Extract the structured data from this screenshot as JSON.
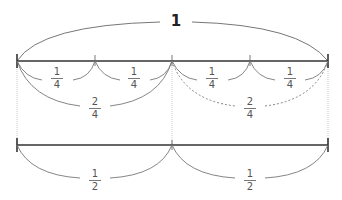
{
  "title": "1",
  "colors": {
    "number_line": "#333333",
    "arc": "#777777",
    "guide": "#bbbbbb",
    "label": "#555555"
  },
  "top_line": {
    "segments": [
      {
        "label_num": "1",
        "label_den": "4"
      },
      {
        "label_num": "1",
        "label_den": "4"
      },
      {
        "label_num": "1",
        "label_den": "4"
      },
      {
        "label_num": "1",
        "label_den": "4"
      }
    ],
    "halves": [
      {
        "label_num": "2",
        "label_den": "4",
        "style": "solid"
      },
      {
        "label_num": "2",
        "label_den": "4",
        "style": "dashed"
      }
    ]
  },
  "bottom_line": {
    "segments": [
      {
        "label_num": "1",
        "label_den": "2"
      },
      {
        "label_num": "1",
        "label_den": "2"
      }
    ]
  }
}
